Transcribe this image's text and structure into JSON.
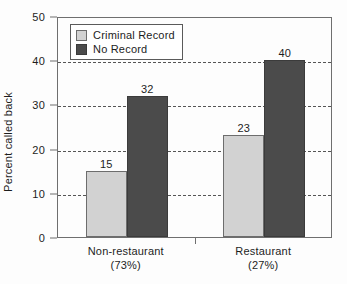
{
  "chart_data": {
    "type": "bar",
    "title": "",
    "subtitle": "",
    "xlabel": "",
    "ylabel": "Percent called back",
    "ylim": [
      0,
      50
    ],
    "ytick_interval": 10,
    "ytick_labels": [
      "0",
      "10",
      "20",
      "30",
      "40",
      "50"
    ],
    "ytick_values": [
      0,
      10,
      20,
      30,
      40,
      50
    ],
    "gridlines": {
      "visible": true,
      "style": "dashed",
      "at_values": [
        10,
        20,
        30,
        40
      ]
    },
    "categories": [
      "Non-restaurant",
      "Restaurant"
    ],
    "category_sublabels": [
      "(73%)",
      "(27%)"
    ],
    "series": [
      {
        "name": "Criminal Record",
        "color": "#d2d2d2",
        "values": [
          15,
          23
        ],
        "value_labels": [
          "15",
          "23"
        ]
      },
      {
        "name": "No Record",
        "color": "#4b4b4b",
        "values": [
          32,
          40
        ],
        "value_labels": [
          "32",
          "40"
        ]
      }
    ],
    "legend": {
      "position": "top-left-inside",
      "entries": [
        {
          "label": "Criminal Record",
          "color": "#d2d2d2"
        },
        {
          "label": "No Record",
          "color": "#4b4b4b"
        }
      ]
    },
    "annotations": []
  },
  "colors": {
    "series_light": "#d2d2d2",
    "series_dark": "#4b4b4b",
    "axis": "#6f6f6f",
    "text": "#1d1d1d",
    "grid": "#555555",
    "background": "#fdfdfd"
  }
}
